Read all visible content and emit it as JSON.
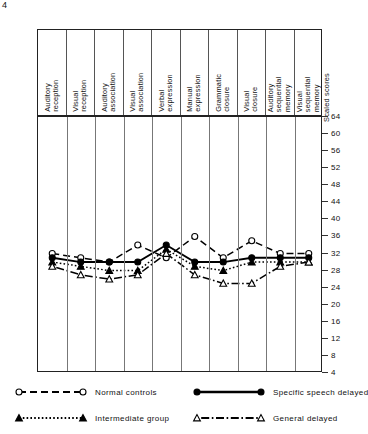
{
  "chart_data": {
    "type": "line",
    "title": "",
    "xlabel": "",
    "ylabel": "Scaled scores",
    "ylim": [
      4,
      64
    ],
    "ytick_step": 4,
    "grid": true,
    "legend_position": "bottom",
    "categories": [
      "Auditory reception",
      "Visual reception",
      "Auditory association",
      "Visual association",
      "Verbal expression",
      "Manual expression",
      "Grammatic closure",
      "Visual closure",
      "Auditory sequential memory",
      "Visual sequential memory"
    ],
    "yticks": [
      64,
      60,
      56,
      52,
      48,
      44,
      40,
      36,
      32,
      28,
      24,
      20,
      16,
      12,
      8,
      4
    ],
    "series": [
      {
        "name": "Normal controls",
        "marker": "open-circle",
        "line": "dashed",
        "values": [
          32,
          31,
          30,
          34,
          31,
          36,
          31,
          35,
          32,
          32
        ]
      },
      {
        "name": "Specific speech delayed",
        "marker": "filled-circle",
        "line": "solid",
        "values": [
          31,
          30,
          30,
          30,
          34,
          30,
          30,
          31,
          31,
          31
        ]
      },
      {
        "name": "Intermediate group",
        "marker": "filled-triangle",
        "line": "dotted",
        "values": [
          30,
          29,
          28,
          28,
          33,
          29,
          28,
          30,
          30,
          30
        ]
      },
      {
        "name": "General delayed",
        "marker": "open-triangle",
        "line": "dash-dot",
        "values": [
          29,
          27,
          26,
          27,
          32,
          27,
          25,
          25,
          29,
          30
        ]
      }
    ]
  },
  "axis": {
    "scaled_scores_label": "Scaled scores"
  },
  "legend": {
    "items": [
      {
        "label": "Normal controls",
        "marker": "open-circle",
        "line": "dashed"
      },
      {
        "label": "Specific speech delayed",
        "marker": "filled-circle",
        "line": "solid"
      },
      {
        "label": "Intermediate group",
        "marker": "filled-triangle",
        "line": "dotted"
      },
      {
        "label": "General delayed",
        "marker": "open-triangle",
        "line": "dash-dot"
      }
    ]
  },
  "corner_mark": "4"
}
